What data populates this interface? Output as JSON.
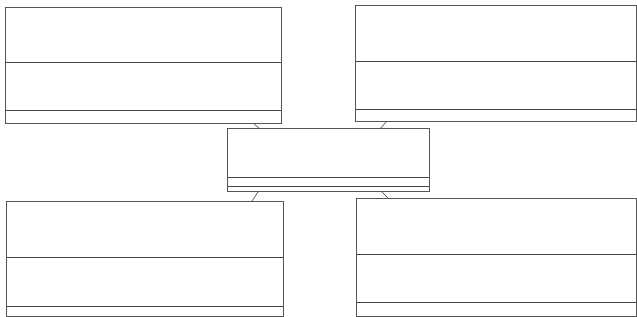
{
  "diagram": {
    "type": "uml-class-diagram",
    "colors": {
      "line": "#555555",
      "background": "#ffffff"
    },
    "classes": [
      {
        "id": "top-left",
        "name": "",
        "attributes": "",
        "methods": "",
        "x": 5,
        "y": 7,
        "w": 277,
        "h": 117,
        "c1": 55,
        "c2": 48
      },
      {
        "id": "top-right",
        "name": "",
        "attributes": "",
        "methods": "",
        "x": 355,
        "y": 5,
        "w": 282,
        "h": 117,
        "c1": 56,
        "c2": 48
      },
      {
        "id": "center",
        "name": "",
        "attributes": "",
        "methods": "",
        "x": 227,
        "y": 128,
        "w": 203,
        "h": 64,
        "c1": 54,
        "c2": 10
      },
      {
        "id": "bottom-left",
        "name": "",
        "attributes": "",
        "methods": "",
        "x": 6,
        "y": 201,
        "w": 278,
        "h": 116,
        "c1": 56,
        "c2": 49
      },
      {
        "id": "bottom-right",
        "name": "",
        "attributes": "",
        "methods": "",
        "x": 356,
        "y": 198,
        "w": 281,
        "h": 119,
        "c1": 56,
        "c2": 48
      }
    ],
    "links": [
      {
        "from": "center",
        "to": "top-left",
        "x1": 260,
        "y1": 129,
        "x2": 253,
        "y2": 123
      },
      {
        "from": "center",
        "to": "top-right",
        "x1": 380,
        "y1": 129,
        "x2": 386,
        "y2": 122
      },
      {
        "from": "center",
        "to": "bottom-left",
        "x1": 258,
        "y1": 192,
        "x2": 252,
        "y2": 201
      },
      {
        "from": "center",
        "to": "bottom-right",
        "x1": 382,
        "y1": 192,
        "x2": 389,
        "y2": 199
      }
    ]
  }
}
